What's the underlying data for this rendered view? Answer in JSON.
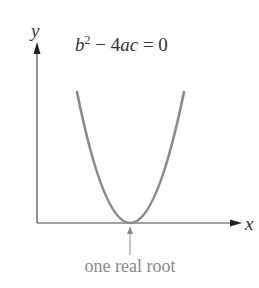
{
  "diagram": {
    "title_equation": {
      "b": "b",
      "exp": "2",
      "minus": " − 4",
      "ac": "ac",
      "eq": " = 0"
    },
    "axes": {
      "y_label": "y",
      "x_label": "x"
    },
    "annotation": {
      "text": "one real root"
    },
    "colors": {
      "axis": "#444444",
      "curve": "#8a8a8a",
      "annotation": "#8a8a8a",
      "text": "#333333"
    }
  }
}
